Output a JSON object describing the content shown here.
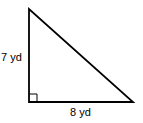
{
  "diagram": {
    "type": "right-triangle",
    "vertices": {
      "top": [
        29,
        9
      ],
      "bottom_left": [
        29,
        102
      ],
      "bottom_right": [
        133,
        102
      ]
    },
    "right_angle_marker_size": 8,
    "stroke_color": "#000000",
    "background_color": "#ffffff",
    "labels": {
      "vertical_side": "7 yd",
      "horizontal_side": "8 yd"
    }
  }
}
